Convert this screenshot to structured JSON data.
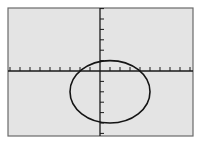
{
  "chart_data": {
    "type": "line",
    "title": "",
    "xlabel": "",
    "ylabel": "",
    "xlim": [
      -9.3,
      9.3
    ],
    "ylim": [
      -6.2,
      6.2
    ],
    "x_tick_step": 1,
    "y_tick_step": 1,
    "grid": false,
    "legend": null,
    "series": [
      {
        "name": "ellipse",
        "shape": "ellipse",
        "center": [
          1,
          -2
        ],
        "semi_axis_x": 4,
        "semi_axis_y": 3,
        "equation": "(x-1)^2/16 + (y+2)^2/9 = 1"
      }
    ]
  },
  "style": {
    "background": "#ffffff",
    "plot_background": "#e4e4e4",
    "frame_color": "#6a6a6a",
    "axis_color": "#1a1a1a",
    "curve_color": "#141414"
  },
  "layout": {
    "frame": {
      "x": 8,
      "y": 8,
      "w": 185,
      "h": 128
    },
    "origin_px": [
      100,
      71
    ],
    "px_per_unit_x": 10,
    "px_per_unit_y": 10.4
  }
}
